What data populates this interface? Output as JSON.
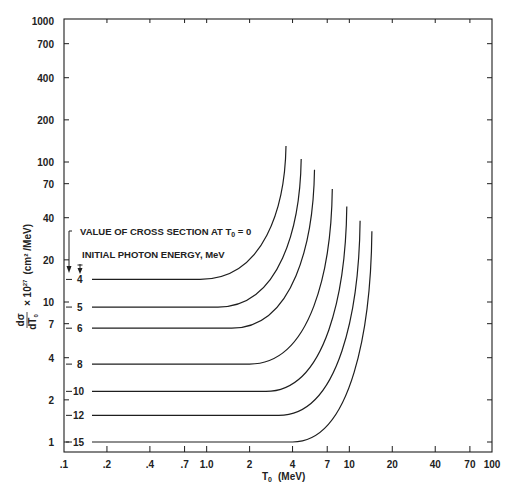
{
  "chart_data": {
    "type": "line",
    "title": "",
    "xlabel": "T0 (MeV)",
    "ylabel": "dσ/dT0 × 10^27 (cm²/MeV)",
    "xscale": "log",
    "yscale": "log",
    "xlim": [
      0.1,
      100
    ],
    "ylim": [
      1,
      1000
    ],
    "grid": false,
    "x_ticks": [
      ".1",
      ".2",
      ".4",
      ".7",
      "1.0",
      "2",
      "4",
      "7",
      "10",
      "20",
      "40",
      "70",
      "100"
    ],
    "x_tick_values": [
      0.1,
      0.2,
      0.4,
      0.7,
      1.0,
      2,
      4,
      7,
      10,
      20,
      40,
      70,
      100
    ],
    "y_ticks": [
      "1",
      "2",
      "4",
      "7",
      "10",
      "20",
      "40",
      "70",
      "100",
      "200",
      "400",
      "700",
      "1000"
    ],
    "y_tick_values": [
      1,
      2,
      4,
      7,
      10,
      20,
      40,
      70,
      100,
      200,
      400,
      700,
      1000
    ],
    "annotations": [
      "VALUE OF CROSS SECTION AT T0 = 0",
      "INITIAL PHOTON ENERGY, MeV"
    ],
    "series": [
      {
        "name": "4",
        "initial_photon_energy_MeV": 4,
        "value_at_T0_0": 14.5,
        "flat_until_T0": 0.9,
        "end_T0": 3.6,
        "end_value": 130
      },
      {
        "name": "5",
        "initial_photon_energy_MeV": 5,
        "value_at_T0_0": 9.2,
        "flat_until_T0": 1.2,
        "end_T0": 4.6,
        "end_value": 105
      },
      {
        "name": "6",
        "initial_photon_energy_MeV": 6,
        "value_at_T0_0": 6.5,
        "flat_until_T0": 1.5,
        "end_T0": 5.7,
        "end_value": 88
      },
      {
        "name": "8",
        "initial_photon_energy_MeV": 8,
        "value_at_T0_0": 3.6,
        "flat_until_T0": 2.0,
        "end_T0": 7.6,
        "end_value": 64
      },
      {
        "name": "10",
        "initial_photon_energy_MeV": 10,
        "value_at_T0_0": 2.3,
        "flat_until_T0": 2.6,
        "end_T0": 9.6,
        "end_value": 48
      },
      {
        "name": "12",
        "initial_photon_energy_MeV": 12,
        "value_at_T0_0": 1.55,
        "flat_until_T0": 3.2,
        "end_T0": 11.9,
        "end_value": 38
      },
      {
        "name": "15",
        "initial_photon_energy_MeV": 15,
        "value_at_T0_0": 1.0,
        "flat_until_T0": 4.0,
        "end_T0": 14.4,
        "end_value": 32
      }
    ]
  },
  "labels": {
    "xlabel_main": "T",
    "xlabel_sub": "0",
    "xlabel_unit": "(MeV)",
    "ylabel_frac_num": "dσ",
    "ylabel_frac_den": "dT",
    "ylabel_frac_den_sub": "0",
    "ylabel_times": "× 10",
    "ylabel_exp": "27",
    "ylabel_unit": "(cm² /MeV)",
    "anno1_main": "VALUE OF CROSS SECTION AT T",
    "anno1_sub": "0",
    "anno1_tail": " = 0",
    "anno2": "INITIAL PHOTON ENERGY, MeV"
  },
  "colors": {
    "ink": "#1e1e1e",
    "background": "#ffffff"
  }
}
